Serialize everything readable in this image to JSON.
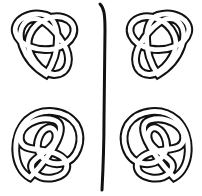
{
  "diagram": {
    "title": "",
    "colors": {
      "ink": "#111111",
      "background": "#ffffff"
    },
    "knots": [
      {
        "id": "trefoil-left",
        "type": "trefoil",
        "handedness": "left",
        "position": "top-left"
      },
      {
        "id": "trefoil-right",
        "type": "trefoil",
        "handedness": "right",
        "position": "top-right"
      },
      {
        "id": "figure-eight-left",
        "type": "figure-eight",
        "handedness": "left",
        "position": "bottom-left"
      },
      {
        "id": "figure-eight-right",
        "type": "figure-eight",
        "handedness": "right",
        "position": "bottom-right"
      }
    ],
    "divider": {
      "type": "vertical-line",
      "label": "mirror"
    }
  }
}
